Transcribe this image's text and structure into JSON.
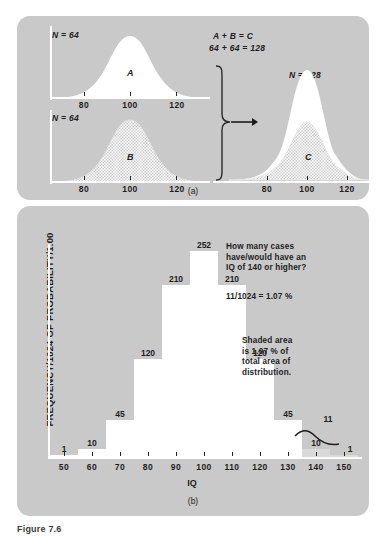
{
  "figure": {
    "caption": "Figure 7.6",
    "panel_a_label": "(a)",
    "panel_b_label": "(b)"
  },
  "panel_a": {
    "equation_line1": "A + B = C",
    "equation_line2": "64 + 64 = 128",
    "curve_a": {
      "n_label": "N = 64",
      "letter": "A",
      "fill": "white",
      "ticks": [
        "80",
        "100",
        "120"
      ]
    },
    "curve_b": {
      "n_label": "N = 64",
      "letter": "B",
      "fill": "hatched",
      "ticks": [
        "80",
        "100",
        "120"
      ]
    },
    "curve_c": {
      "n_label": "N = 128",
      "letter": "C",
      "fill": "white-over-hatched",
      "ticks": [
        "80",
        "100",
        "120"
      ]
    },
    "arrow_icon": "right-arrow-icon",
    "brace_icon": "curly-brace-icon"
  },
  "panel_b": {
    "question_note": "How many cases\nhave/would have an\nIQ of 140 or higher?",
    "question_note_lines": [
      "How many cases",
      "have/would have an",
      "IQ of 140 or higher?"
    ],
    "calculation": "11/1024 = 1.07 %",
    "shaded_note_lines": [
      "Shaded area",
      "is 1.07 % of",
      "total area of",
      "distribution."
    ],
    "pointer_label": "11"
  },
  "chart_data": {
    "type": "bar",
    "title": "",
    "xlabel": "IQ",
    "ylabel": "FREQUENCY/1024 OF PROBABILITY/1.00",
    "categories": [
      "50",
      "60",
      "70",
      "80",
      "90",
      "100",
      "110",
      "120",
      "130",
      "140",
      "150"
    ],
    "values": [
      1,
      10,
      45,
      120,
      210,
      252,
      210,
      120,
      45,
      10,
      1
    ],
    "bar_labels": [
      "1",
      "10",
      "45",
      "120",
      "210",
      "252",
      "210",
      "120",
      "45",
      "10",
      "1"
    ],
    "shaded_categories": [
      "140",
      "150"
    ],
    "shaded_total": 11,
    "grand_total": 1024,
    "shaded_percent": "1.07 %",
    "ylim": [
      0,
      252
    ],
    "xlim": [
      45,
      155
    ],
    "grid": false,
    "legend": false
  },
  "colors": {
    "panel_background": "#c9c9c9",
    "bar_fill": "#ffffff",
    "shaded_bar_fill": "#d9d9d9",
    "text": "#1d1d1d",
    "axis": "#ffffff"
  }
}
